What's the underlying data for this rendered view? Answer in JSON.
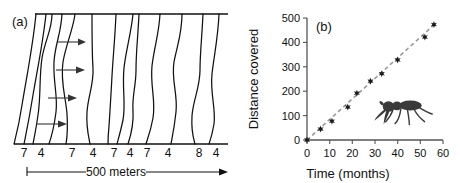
{
  "figure": {
    "panels": [
      {
        "id": "a",
        "label": "(a)",
        "scale_bar_label": "500 meters",
        "transect_labels": [
          "7",
          "4",
          "7",
          "4",
          "7",
          "4",
          "7",
          "4",
          "8",
          "4"
        ],
        "arrow_count": 4,
        "wave_line_count": 12,
        "description": "Map transect showing meandering contour lines with rightward arrows"
      },
      {
        "id": "b",
        "label": "(b)",
        "ant_icon": "ant-illustration"
      }
    ]
  },
  "chart_data": {
    "type": "scatter",
    "title": "",
    "panel_label": "(b)",
    "xlabel": "Time (months)",
    "ylabel": "Distance covered",
    "xlim": [
      0,
      60
    ],
    "ylim": [
      0,
      500
    ],
    "xticks": [
      0,
      10,
      20,
      30,
      40,
      50,
      60
    ],
    "yticks": [
      0,
      100,
      200,
      300,
      400,
      500
    ],
    "xtick_labels": [
      "0",
      "10",
      "20",
      "30",
      "40",
      "50",
      "60"
    ],
    "ytick_labels": [
      "0",
      "100",
      "200",
      "300",
      "400",
      "500"
    ],
    "grid": false,
    "legend": false,
    "series": [
      {
        "name": "Distance covered",
        "marker": "star",
        "x": [
          0,
          6,
          11,
          18,
          22,
          28,
          33,
          40,
          52,
          56
        ],
        "y": [
          0,
          45,
          77,
          135,
          192,
          241,
          272,
          328,
          422,
          473
        ]
      }
    ],
    "trendline": {
      "type": "linear",
      "style": "dashed",
      "color": "#9a9a9a",
      "x": [
        0,
        57
      ],
      "y": [
        0,
        480
      ]
    },
    "annotations": [
      {
        "name": "ant-illustration",
        "x": 44,
        "y": 150
      }
    ]
  },
  "colors": {
    "line": "#111111",
    "trend": "#9a9a9a",
    "axis": "#555555",
    "marker": "#1a1a1a",
    "background": "#ffffff"
  }
}
